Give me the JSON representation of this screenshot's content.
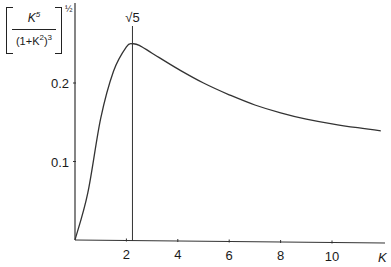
{
  "chart_data": {
    "type": "line",
    "title": "",
    "ylabel": "[K^5/(1+K^2)^3]^(1/2)",
    "ylabel_parts": {
      "numerator": "K",
      "numerator_exp": "5",
      "denominator_pre": "(1+K",
      "denominator_exp1": "2",
      "denominator_mid": ")",
      "denominator_exp2": "3",
      "power": "½"
    },
    "xlabel": "K",
    "x_ticks": [
      "2",
      "4",
      "6",
      "8",
      "10"
    ],
    "y_ticks": [
      "0.1",
      "0.2"
    ],
    "xlim": [
      0,
      12
    ],
    "ylim": [
      0,
      0.3
    ],
    "grid": false,
    "annotation": {
      "text": "√5",
      "x": 2.236,
      "type": "vertical-line"
    },
    "series": [
      {
        "name": "[K^5/(1+K^2)^3]^(1/2)",
        "x": [
          0,
          0.5,
          1.0,
          1.5,
          2.0,
          2.236,
          2.5,
          3,
          4,
          5,
          6,
          7,
          8,
          9,
          10,
          11,
          11.9
        ],
        "values": [
          0,
          0.06,
          0.155,
          0.215,
          0.246,
          0.25,
          0.248,
          0.238,
          0.218,
          0.2,
          0.185,
          0.172,
          0.162,
          0.154,
          0.148,
          0.143,
          0.139
        ]
      }
    ]
  }
}
